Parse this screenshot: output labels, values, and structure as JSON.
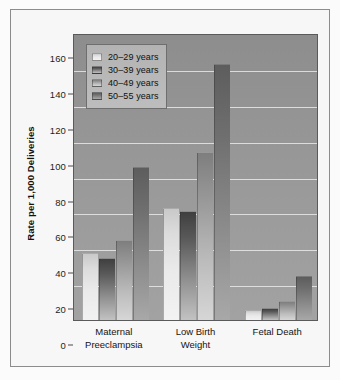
{
  "chart_data": {
    "type": "bar",
    "title": "",
    "xlabel": "",
    "ylabel": "Rate per 1,000 Deliveries",
    "ylim": [
      0,
      160
    ],
    "ytick_step": 20,
    "yticks": [
      "0",
      "20",
      "40",
      "60",
      "80",
      "100",
      "120",
      "140",
      "160"
    ],
    "grid": true,
    "legend_position": "top-left inside plot",
    "categories": [
      "Maternal Preeclampsia",
      "Low Birth Weight",
      "Fetal Death"
    ],
    "category_lines": [
      [
        "Maternal",
        "Preeclampsia"
      ],
      [
        "Low Birth",
        "Weight"
      ],
      [
        "Fetal Death",
        ""
      ]
    ],
    "series": [
      {
        "name": "20–29 years",
        "values": [
          37,
          62,
          5
        ]
      },
      {
        "name": "30–39 years",
        "values": [
          34,
          60,
          6
        ]
      },
      {
        "name": "40–49 years",
        "values": [
          44,
          93,
          10
        ]
      },
      {
        "name": "50–55 years",
        "values": [
          85,
          142,
          24
        ]
      }
    ]
  },
  "legend": {
    "items": [
      {
        "label": "20–29 years",
        "swatch": "light-gray"
      },
      {
        "label": "30–39 years",
        "swatch": "dark-gray"
      },
      {
        "label": "40–49 years",
        "swatch": "medium-gray"
      },
      {
        "label": "50–55 years",
        "swatch": "mid-dark-gray"
      }
    ]
  },
  "colors": {
    "plot_background": "#949494",
    "gridline": "#e9e9e9",
    "frame_border": "#8c8c8c",
    "figure_background": "#fbfbfb",
    "legend_background": "#b8b8b8",
    "axis_text": "#141414"
  }
}
